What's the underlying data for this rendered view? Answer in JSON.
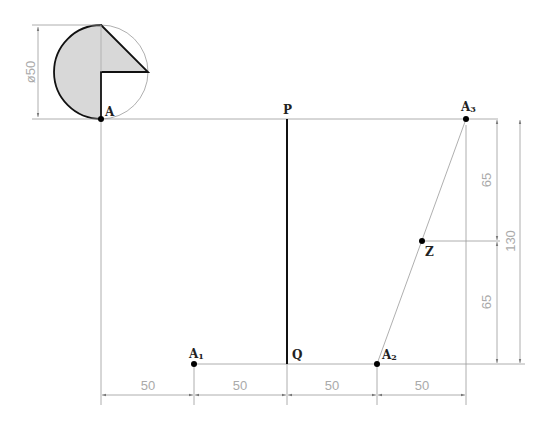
{
  "figure": {
    "type": "geometric construction diagram",
    "colors": {
      "line": "#111111",
      "thin": "#9a9a9a",
      "dim_text": "#aaaaaa",
      "fill": "#d8d8d8"
    }
  },
  "circle": {
    "diameter_label": "ø50"
  },
  "points": {
    "A": {
      "label": "A",
      "sub": ""
    },
    "P": {
      "label": "P",
      "sub": ""
    },
    "A3": {
      "label": "A",
      "sub": "3"
    },
    "Z": {
      "label": "Z",
      "sub": ""
    },
    "A1": {
      "label": "A",
      "sub": "1"
    },
    "Q": {
      "label": "Q",
      "sub": ""
    },
    "A2": {
      "label": "A",
      "sub": "2"
    }
  },
  "dimensions": {
    "bottom": [
      "50",
      "50",
      "50",
      "50"
    ],
    "right_upper": "65",
    "right_lower": "65",
    "right_total": "130"
  }
}
